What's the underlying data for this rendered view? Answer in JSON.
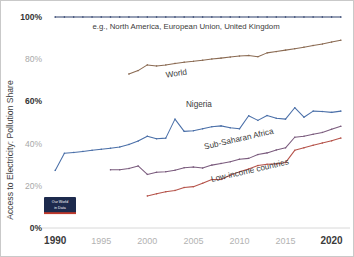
{
  "chart_data": {
    "type": "line",
    "title": "",
    "xlabel": "",
    "ylabel": "Access to Electricity: Pollution Share",
    "xlim": [
      1989,
      2022
    ],
    "ylim": [
      0,
      100
    ],
    "grid": false,
    "legend_position": "inline-labels",
    "y_ticks": [
      {
        "value": 100,
        "label": "100%",
        "emphasis": "strong"
      },
      {
        "value": 80,
        "label": "80%",
        "emphasis": "faint"
      },
      {
        "value": 60,
        "label": "60%",
        "emphasis": "strong"
      },
      {
        "value": 40,
        "label": "40%",
        "emphasis": "faint"
      },
      {
        "value": 20,
        "label": "20%",
        "emphasis": "faint"
      },
      {
        "value": 0,
        "label": "0%",
        "emphasis": "strong"
      }
    ],
    "x_ticks": [
      {
        "value": 1990,
        "label": "1990",
        "emphasis": "strong"
      },
      {
        "value": 1995,
        "label": "1995",
        "emphasis": "faint"
      },
      {
        "value": 2000,
        "label": "2000",
        "emphasis": "faint"
      },
      {
        "value": 2005,
        "label": "2005",
        "emphasis": "faint"
      },
      {
        "value": 2010,
        "label": "2010",
        "emphasis": "faint"
      },
      {
        "value": 2015,
        "label": "2015",
        "emphasis": "faint"
      },
      {
        "value": 2020,
        "label": "2020",
        "emphasis": "strong"
      }
    ],
    "annotations": [
      {
        "name": "high-income-note",
        "text": "e.g., North America, European Union, United Kingdom",
        "x": 2004.2,
        "y": 94.5,
        "rotation": 0
      }
    ],
    "series": [
      {
        "name": "High-income group",
        "label": "",
        "color": "#2c3e6b",
        "x": [
          1990,
          1991,
          1992,
          1993,
          1994,
          1995,
          1996,
          1997,
          1998,
          1999,
          2000,
          2001,
          2002,
          2003,
          2004,
          2005,
          2006,
          2007,
          2008,
          2009,
          2010,
          2011,
          2012,
          2013,
          2014,
          2015,
          2016,
          2017,
          2018,
          2019,
          2020,
          2021
        ],
        "values": [
          100,
          100,
          100,
          100,
          100,
          100,
          100,
          100,
          100,
          100,
          100,
          100,
          100,
          100,
          100,
          100,
          100,
          100,
          100,
          100,
          100,
          100,
          100,
          100,
          100,
          100,
          100,
          100,
          100,
          100,
          100,
          100
        ],
        "label_x": 0,
        "label_y": 0,
        "label_rotation": 0
      },
      {
        "name": "World",
        "label": "World",
        "color": "#8a6a52",
        "x": [
          1998,
          1999,
          2000,
          2001,
          2002,
          2003,
          2004,
          2005,
          2006,
          2007,
          2008,
          2009,
          2010,
          2011,
          2012,
          2013,
          2014,
          2015,
          2016,
          2017,
          2018,
          2019,
          2020,
          2021
        ],
        "values": [
          73.0,
          74.6,
          77.3,
          76.8,
          77.3,
          78.0,
          78.6,
          79.0,
          79.5,
          80.1,
          80.5,
          81.0,
          81.5,
          81.8,
          81.2,
          83.0,
          83.6,
          84.3,
          85.0,
          85.7,
          86.5,
          87.2,
          88.1,
          89.0
        ],
        "label_x": 2003.2,
        "label_y": 72.0,
        "label_rotation": -9
      },
      {
        "name": "Nigeria",
        "label": "Nigeria",
        "color": "#4a6fa8",
        "x": [
          1990,
          1991,
          1992,
          1993,
          1994,
          1995,
          1996,
          1997,
          1998,
          1999,
          2000,
          2001,
          2002,
          2003,
          2004,
          2005,
          2006,
          2007,
          2008,
          2009,
          2010,
          2011,
          2012,
          2013,
          2014,
          2015,
          2016,
          2017,
          2018,
          2019,
          2020,
          2021
        ],
        "values": [
          27.3,
          35.4,
          35.8,
          36.3,
          36.8,
          37.3,
          37.8,
          38.4,
          39.6,
          41.2,
          43.5,
          42.3,
          42.6,
          51.6,
          45.8,
          46.1,
          47.0,
          48.0,
          48.4,
          47.5,
          47.0,
          53.2,
          51.0,
          53.3,
          52.0,
          51.6,
          57.0,
          52.5,
          55.4,
          55.2,
          54.8,
          55.4
        ],
        "label_x": 2005.6,
        "label_y": 57.5,
        "label_rotation": 0
      },
      {
        "name": "Sub-Saharan Africa",
        "label": "Sub-Saharan Africa",
        "color": "#7a5b7d",
        "x": [
          1996,
          1997,
          1998,
          1999,
          2000,
          2001,
          2002,
          2003,
          2004,
          2005,
          2006,
          2007,
          2008,
          2009,
          2010,
          2011,
          2012,
          2013,
          2014,
          2015,
          2016,
          2017,
          2018,
          2019,
          2020,
          2021
        ],
        "values": [
          27.6,
          27.6,
          28.2,
          29.4,
          25.4,
          26.4,
          26.7,
          27.4,
          28.6,
          28.9,
          28.4,
          29.8,
          30.6,
          31.4,
          32.6,
          33.0,
          34.8,
          35.6,
          37.0,
          38.0,
          43.0,
          43.5,
          44.4,
          45.3,
          46.8,
          48.2
        ],
        "label_x": 2010.0,
        "label_y": 41.0,
        "label_rotation": -13
      },
      {
        "name": "Low-income countries",
        "label": "Low-income countries",
        "color": "#b5534a",
        "x": [
          2000,
          2001,
          2002,
          2003,
          2004,
          2005,
          2006,
          2007,
          2008,
          2009,
          2010,
          2011,
          2012,
          2013,
          2014,
          2015,
          2016,
          2017,
          2018,
          2019,
          2020,
          2021
        ],
        "values": [
          15.2,
          16.2,
          17.2,
          17.8,
          19.2,
          19.6,
          21.2,
          23.0,
          23.0,
          25.0,
          26.6,
          28.0,
          29.6,
          30.2,
          30.4,
          31.0,
          36.8,
          38.0,
          39.2,
          40.3,
          41.3,
          42.6
        ],
        "label_x": 2011.2,
        "label_y": 26.0,
        "label_rotation": -13
      }
    ]
  },
  "branding": {
    "line1": "Our World",
    "line2": "in Data",
    "box_color": "#1d2a4d",
    "accent_color": "#c0392b"
  }
}
